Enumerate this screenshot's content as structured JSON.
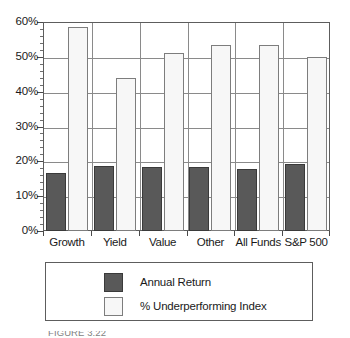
{
  "chart_data": {
    "type": "bar",
    "title": "",
    "xlabel": "",
    "ylabel": "",
    "categories": [
      "Growth",
      "Yield",
      "Value",
      "Other",
      "All Funds",
      "S&P 500"
    ],
    "series": [
      {
        "name": "Annual Return",
        "values": [
          16.7,
          18.6,
          18.4,
          18.3,
          17.8,
          19.3
        ],
        "color": "#595959"
      },
      {
        "name": "% Underperforming Index",
        "values": [
          58.5,
          43.9,
          51.0,
          53.3,
          53.3,
          50.0
        ],
        "color": "#f7f7f7"
      }
    ],
    "ylim": [
      0,
      60
    ],
    "ytick_values": [
      0,
      10,
      20,
      30,
      40,
      50,
      60
    ],
    "ytick_labels": [
      "0%",
      "10%",
      "20%",
      "30%",
      "40%",
      "50%",
      "60%"
    ],
    "yminor_step": 2,
    "grid": "horizontal-and-category-separators",
    "legend_position": "below-plot",
    "legend_entries": [
      {
        "label": "Annual Return",
        "swatch": "dark-gray-filled"
      },
      {
        "label": "% Underperforming Index",
        "swatch": "white-outlined"
      }
    ]
  },
  "axis": {
    "y_labels": [
      "60%",
      "50%",
      "40%",
      "30%",
      "20%",
      "10%",
      "0%"
    ],
    "x_labels": [
      "Growth",
      "Yield",
      "Value",
      "Other",
      "All Funds",
      "S&P 500"
    ]
  },
  "legend": {
    "items": [
      {
        "label": "Annual Return"
      },
      {
        "label": "% Underperforming Index"
      }
    ]
  },
  "caption": {
    "partial_text": "FIGURE 3.22"
  },
  "colors": {
    "annual_return": "#595959",
    "underperforming_index": "#f7f7f7",
    "gridline": "#8a8a8a",
    "frame": "#5d5d5d",
    "text": "#1a1a1a"
  }
}
